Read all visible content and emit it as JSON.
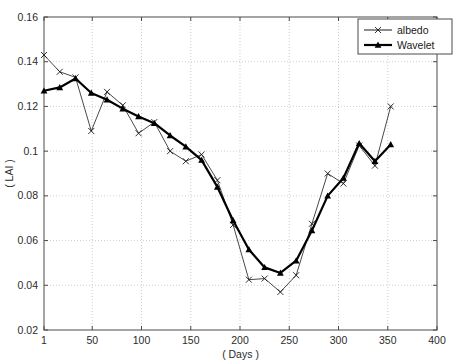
{
  "chart_data": {
    "type": "line",
    "title": "",
    "xlabel": "( Days )",
    "ylabel": "( LAI )",
    "xlim": [
      1,
      400
    ],
    "ylim": [
      0.02,
      0.16
    ],
    "xticks": [
      1,
      50,
      100,
      150,
      200,
      250,
      300,
      350,
      400
    ],
    "xticklabels": [
      "1",
      "50",
      "100",
      "150",
      "200",
      "250",
      "300",
      "350",
      "400"
    ],
    "yticks": [
      0.02,
      0.04,
      0.06,
      0.08,
      0.1,
      0.12,
      0.14,
      0.16
    ],
    "yticklabels": [
      "0.02",
      "0.04",
      "0.06",
      "0.08",
      "0.1",
      "0.12",
      "0.14",
      "0.16"
    ],
    "grid": true,
    "grid_style": "dotted",
    "legend_position": "top-right",
    "series": [
      {
        "name": "albedo",
        "marker": "x",
        "linewidth": 0.8,
        "color": "#1a1a1a",
        "x": [
          1,
          17,
          33,
          49,
          65,
          81,
          97,
          113,
          129,
          145,
          161,
          177,
          193,
          209,
          225,
          241,
          257,
          273,
          289,
          305,
          321,
          337,
          353
        ],
        "y": [
          0.143,
          0.1355,
          0.133,
          0.109,
          0.1265,
          0.1205,
          0.108,
          0.113,
          0.1,
          0.0955,
          0.0985,
          0.087,
          0.067,
          0.0425,
          0.043,
          0.037,
          0.0445,
          0.0675,
          0.09,
          0.0855,
          0.1025,
          0.0935,
          0.12
        ]
      },
      {
        "name": "Wavelet",
        "marker": "triangle",
        "linewidth": 2.2,
        "color": "#000000",
        "x": [
          1,
          17,
          33,
          49,
          65,
          81,
          97,
          113,
          129,
          145,
          161,
          177,
          193,
          209,
          225,
          241,
          257,
          273,
          289,
          305,
          321,
          337,
          353
        ],
        "y": [
          0.127,
          0.1285,
          0.1325,
          0.126,
          0.123,
          0.119,
          0.1155,
          0.1125,
          0.107,
          0.102,
          0.096,
          0.084,
          0.069,
          0.056,
          0.048,
          0.0455,
          0.051,
          0.0645,
          0.08,
          0.088,
          0.1035,
          0.0955,
          0.103
        ]
      }
    ]
  },
  "legend": {
    "entries": [
      {
        "label": "albedo",
        "marker": "x"
      },
      {
        "label": "Wavelet",
        "marker": "triangle"
      }
    ]
  },
  "axes": {
    "x_axis_label": "( Days )",
    "y_axis_label": "( LAI )"
  }
}
